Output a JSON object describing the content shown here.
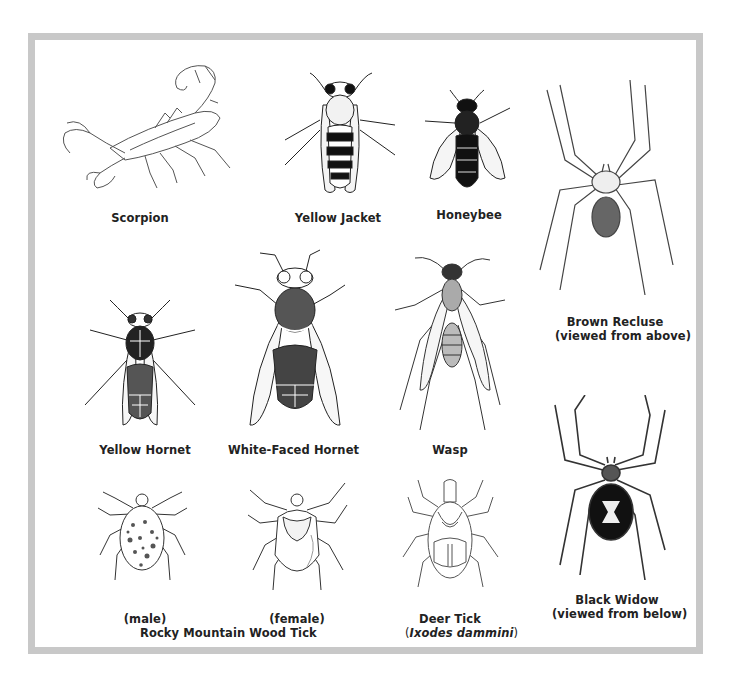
{
  "figure": {
    "frame_color": "#c8c8c8",
    "specimens": [
      {
        "id": "scorpion",
        "label": "Scorpion"
      },
      {
        "id": "yellow-jacket",
        "label": "Yellow Jacket"
      },
      {
        "id": "honeybee",
        "label": "Honeybee"
      },
      {
        "id": "brown-recluse",
        "label": "Brown Recluse",
        "sublabel": "(viewed from above)"
      },
      {
        "id": "yellow-hornet",
        "label": "Yellow Hornet"
      },
      {
        "id": "white-faced-hornet",
        "label": "White-Faced Hornet"
      },
      {
        "id": "wasp",
        "label": "Wasp"
      },
      {
        "id": "black-widow",
        "label": "Black Widow",
        "sublabel": "(viewed from below)"
      },
      {
        "id": "wood-tick-male",
        "label": "(male)"
      },
      {
        "id": "wood-tick-female",
        "label": "(female)"
      },
      {
        "id": "deer-tick",
        "label": "Deer Tick",
        "sublabel_prefix": "(",
        "sublabel_italic": "Ixodes dammini",
        "sublabel_suffix": ")"
      }
    ],
    "group_labels": {
      "wood_tick": "Rocky Mountain Wood Tick"
    }
  }
}
